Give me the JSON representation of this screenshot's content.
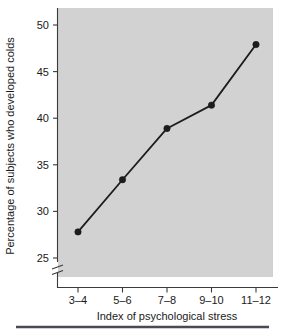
{
  "chart_data": {
    "type": "line",
    "title": "",
    "xlabel": "Index of psychological stress",
    "ylabel": "Percentage of subjects who developed colds",
    "categories": [
      "3–4",
      "5–6",
      "7–8",
      "9–10",
      "11–12"
    ],
    "values": [
      27.8,
      33.4,
      38.9,
      41.4,
      47.9
    ],
    "series": [
      {
        "name": "Percentage of subjects who developed colds",
        "values": [
          27.8,
          33.4,
          38.9,
          41.4,
          47.9
        ]
      }
    ],
    "ylim": [
      25,
      51
    ],
    "yticks": [
      25,
      30,
      35,
      40,
      45,
      50
    ],
    "ytick_labels": [
      "25",
      "30",
      "35",
      "40",
      "45",
      "50"
    ],
    "y_origin_label": "0",
    "axis_break": true,
    "grid": false,
    "legend": "none",
    "marker": "filled-circle",
    "plot_background_color": "#d2d2d2",
    "line_color": "#1c1c1c",
    "text_color": "#1a1a1a"
  },
  "axes": {
    "y_axis_label": "Percentage of subjects who developed colds",
    "x_axis_label": "Index of psychological stress",
    "y_tick_0": "0",
    "y_tick_25": "25",
    "y_tick_30": "30",
    "y_tick_35": "35",
    "y_tick_40": "40",
    "y_tick_45": "45",
    "y_tick_50": "50",
    "x_tick_1": "3–4",
    "x_tick_2": "5–6",
    "x_tick_3": "7–8",
    "x_tick_4": "9–10",
    "x_tick_5": "11–12"
  }
}
